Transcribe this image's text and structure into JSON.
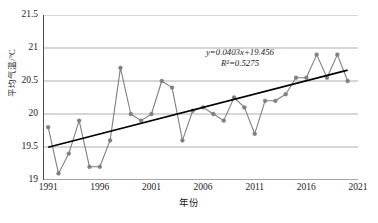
{
  "chart_data": {
    "type": "line",
    "title": "",
    "xlabel": "年份",
    "ylabel": "平均气温/°C",
    "xlim": [
      1990.5,
      2021
    ],
    "ylim": [
      19,
      21.5
    ],
    "ytick_values": [
      19,
      19.5,
      20,
      20.5,
      21,
      21.5
    ],
    "ytick_labels": [
      "19",
      "19.5",
      "20",
      "20.5",
      "21",
      "21.5"
    ],
    "xtick_values": [
      1991,
      1996,
      2001,
      2006,
      2011,
      2016,
      2021
    ],
    "xtick_labels": [
      "1991",
      "1996",
      "2001",
      "2006",
      "2011",
      "2016",
      "2021"
    ],
    "grid": "horizontal",
    "legend": "none",
    "x": [
      1991,
      1992,
      1993,
      1994,
      1995,
      1996,
      1997,
      1998,
      1999,
      2000,
      2001,
      2002,
      2003,
      2004,
      2005,
      2006,
      2007,
      2008,
      2009,
      2010,
      2011,
      2012,
      2013,
      2014,
      2015,
      2016,
      2017,
      2018,
      2019,
      2020
    ],
    "series": [
      {
        "name": "平均气温",
        "color": "#7f7f7f",
        "marker": "circle",
        "values": [
          19.8,
          19.1,
          19.4,
          19.9,
          19.2,
          19.2,
          19.6,
          20.7,
          20.0,
          19.9,
          20.0,
          20.5,
          20.4,
          19.6,
          20.05,
          20.1,
          20.0,
          19.9,
          20.25,
          20.1,
          19.7,
          20.2,
          20.2,
          20.3,
          20.55,
          20.55,
          20.9,
          20.55,
          20.9,
          20.5
        ]
      }
    ],
    "trendline": {
      "name": "线性趋势线",
      "color": "#000000",
      "slope": 0.0403,
      "intercept": 19.456,
      "x_start": 1991,
      "x_end": 2020,
      "equation": "y=0.0403x+19.456",
      "r_squared": "R²=0.5275"
    },
    "annotations": [
      {
        "text": "y=0.0403x+19.456"
      },
      {
        "text": "R²=0.5275"
      }
    ]
  },
  "axes": {
    "y_title": "平均气温/°C",
    "x_title": "年份"
  },
  "equation": {
    "line1": "y=0.0403x+19.456",
    "line2": "R²=0.5275"
  }
}
